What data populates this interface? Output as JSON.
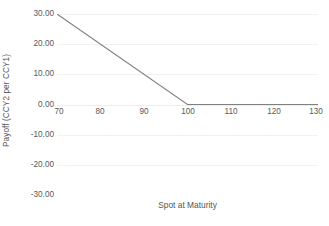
{
  "chart_data": {
    "type": "line",
    "title": "",
    "subtitle": "",
    "xlabel": "Spot at Maturity",
    "ylabel": "Payoff (CCY2 per CCY1)",
    "xlim": [
      70,
      130
    ],
    "ylim": [
      -30,
      30
    ],
    "xticks": [
      70,
      80,
      90,
      100,
      110,
      120,
      130
    ],
    "xtick_labels": [
      "70",
      "80",
      "90",
      "100",
      "110",
      "120",
      "130"
    ],
    "yticks": [
      30,
      20,
      10,
      0,
      -10,
      -20,
      -30
    ],
    "ytick_labels": [
      "30.00",
      "20.00",
      "10.00",
      "0.00",
      "-10.00",
      "-20.00",
      "-30.00"
    ],
    "grid": {
      "horizontal": true,
      "vertical": false,
      "color": "#f2f2f2"
    },
    "legend": {
      "visible": false,
      "position": "none",
      "entries": []
    },
    "annotations": [],
    "series": [
      {
        "name": "Payoff",
        "color": "#808080",
        "line_width": 1,
        "x": [
          70,
          100,
          130
        ],
        "values": [
          30.0,
          0.0,
          0.0
        ]
      }
    ],
    "background_color": "#ffffff",
    "text_color": "#595959"
  }
}
